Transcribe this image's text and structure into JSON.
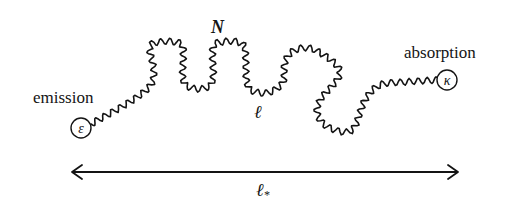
{
  "diagram": {
    "type": "photon random walk",
    "labels": {
      "emission": "emission",
      "absorption": "absorption",
      "N": "N",
      "step_length": "ℓ",
      "total_length": "ℓ",
      "total_length_subscript": "*",
      "emission_symbol": "ε",
      "absorption_symbol": "κ"
    },
    "colors": {
      "stroke": "#141414",
      "background": "#ffffff"
    },
    "emitter": {
      "cx": 81,
      "cy": 128,
      "r": 10
    },
    "absorber": {
      "cx": 447,
      "cy": 80,
      "r": 10
    },
    "walk_path": {
      "amplitude": 3.2,
      "wavelength": 9,
      "points": [
        [
          91,
          124
        ],
        [
          150,
          86
        ],
        [
          150,
          48
        ],
        [
          160,
          42
        ],
        [
          175,
          42
        ],
        [
          183,
          48
        ],
        [
          183,
          80
        ],
        [
          192,
          88
        ],
        [
          205,
          88
        ],
        [
          213,
          80
        ],
        [
          213,
          48
        ],
        [
          222,
          42
        ],
        [
          238,
          42
        ],
        [
          245,
          50
        ],
        [
          247,
          84
        ],
        [
          256,
          92
        ],
        [
          270,
          92
        ],
        [
          283,
          82
        ],
        [
          285,
          62
        ],
        [
          295,
          50
        ],
        [
          315,
          50
        ],
        [
          340,
          72
        ],
        [
          320,
          100
        ],
        [
          318,
          116
        ],
        [
          330,
          128
        ],
        [
          352,
          130
        ],
        [
          365,
          100
        ],
        [
          380,
          85
        ],
        [
          405,
          82
        ],
        [
          437,
          80
        ]
      ]
    },
    "arrow": {
      "x1": 72,
      "x2": 458,
      "y": 172
    }
  }
}
